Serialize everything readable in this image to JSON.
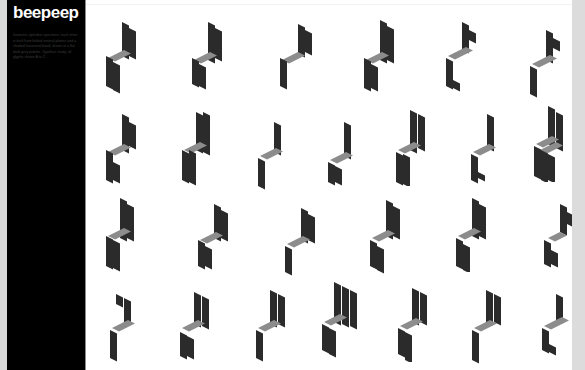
{
  "sidebar": {
    "logo": "beepeep",
    "blurb": "Isometric alphabet specimen: each letter is built from folded vertical planes and a shaded horizontal band, drawn in a flat dark-grey palette. Typeface study, all glyphs shown A to Z."
  },
  "colors": {
    "vertical": "#2b2b2b",
    "horizontal": "#8c8c8c",
    "sidebar": "#000000",
    "background": "#ffffff"
  },
  "glyphs": [
    {
      "letter": "A",
      "x": 102,
      "y": 18
    },
    {
      "letter": "B",
      "x": 186,
      "y": 18
    },
    {
      "letter": "C",
      "x": 276,
      "y": 18
    },
    {
      "letter": "D",
      "x": 360,
      "y": 18
    },
    {
      "letter": "E",
      "x": 442,
      "y": 18
    },
    {
      "letter": "F",
      "x": 526,
      "y": 22
    },
    {
      "letter": "G",
      "x": 102,
      "y": 112
    },
    {
      "letter": "H",
      "x": 178,
      "y": 110
    },
    {
      "letter": "I",
      "x": 252,
      "y": 116
    },
    {
      "letter": "J",
      "x": 322,
      "y": 118
    },
    {
      "letter": "K",
      "x": 392,
      "y": 110
    },
    {
      "letter": "L",
      "x": 465,
      "y": 112
    },
    {
      "letter": "M",
      "x": 532,
      "y": 106
    },
    {
      "letter": "N",
      "x": 102,
      "y": 196
    },
    {
      "letter": "O",
      "x": 194,
      "y": 200
    },
    {
      "letter": "P",
      "x": 281,
      "y": 202
    },
    {
      "letter": "Q",
      "x": 366,
      "y": 198
    },
    {
      "letter": "R",
      "x": 452,
      "y": 196
    },
    {
      "letter": "S",
      "x": 538,
      "y": 200
    },
    {
      "letter": "T",
      "x": 106,
      "y": 288
    },
    {
      "letter": "U",
      "x": 176,
      "y": 288
    },
    {
      "letter": "V",
      "x": 252,
      "y": 288
    },
    {
      "letter": "W",
      "x": 320,
      "y": 282
    },
    {
      "letter": "X",
      "x": 394,
      "y": 286
    },
    {
      "letter": "Y",
      "x": 468,
      "y": 288
    },
    {
      "letter": "Z",
      "x": 538,
      "y": 288
    }
  ]
}
